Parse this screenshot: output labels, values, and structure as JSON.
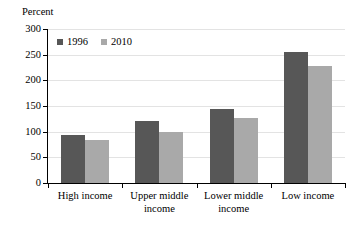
{
  "chart_data": {
    "type": "bar",
    "title": "",
    "subtitle": "",
    "xlabel": "",
    "ylabel": "Percent",
    "ylim": [
      0,
      300
    ],
    "yticks": [
      0,
      50,
      100,
      150,
      200,
      250,
      300
    ],
    "ytick_labels": [
      "0",
      "50",
      "100",
      "150",
      "200",
      "250",
      "300"
    ],
    "grid": "horizontal",
    "legend_position": "top-left inside plot",
    "categories": [
      "High income",
      "Upper middle income",
      "Lower middle income",
      "Low income"
    ],
    "category_label_lines": [
      [
        "High income"
      ],
      [
        "Upper middle",
        "income"
      ],
      [
        "Lower middle",
        "income"
      ],
      [
        "Low income"
      ]
    ],
    "series": [
      {
        "name": "1996",
        "color": "#575757",
        "values": [
          93,
          121,
          145,
          256
        ]
      },
      {
        "name": "2010",
        "color": "#a9a9a9",
        "values": [
          83,
          99,
          126,
          227
        ]
      }
    ]
  },
  "colors": {
    "series_1996": "#575757",
    "series_2010": "#a9a9a9",
    "gridline": "#e3e3e3",
    "axis": "#000000",
    "background": "#ffffff"
  }
}
